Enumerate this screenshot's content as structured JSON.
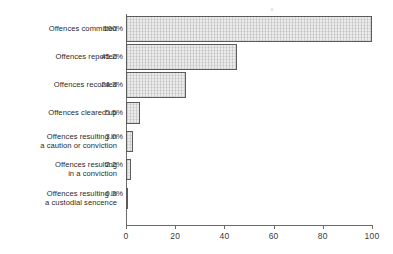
{
  "chart_data": {
    "type": "bar",
    "orientation": "horizontal",
    "title": "",
    "subtitle": "",
    "xlabel": "",
    "ylabel": "",
    "xlim": [
      0,
      100
    ],
    "grid": false,
    "legend": null,
    "categories": [
      "Offences committed",
      "Offences reported",
      "Offences recorded",
      "Offences cleared up",
      "Offences resulting in a caution or conviction",
      "Offences resulting in a conviction",
      "Offences resulting in a custodial sencence"
    ],
    "category_lines": [
      [
        "Offences committed"
      ],
      [
        "Offences reported"
      ],
      [
        "Offences recorded"
      ],
      [
        "Offences cleared up"
      ],
      [
        "Offences resulting in",
        "a caution or conviction"
      ],
      [
        "Offences resulting",
        "in a conviction"
      ],
      [
        "Offences resulting in",
        "a custodial sencence"
      ]
    ],
    "values": [
      100,
      45.2,
      24.3,
      5.5,
      3.0,
      2.2,
      0.3
    ],
    "value_labels": [
      "100%",
      "45.2%",
      "24.3%",
      "5.5%",
      "3.0%",
      "2.2%",
      "0.3%"
    ],
    "xticks": [
      0,
      20,
      40,
      60,
      80,
      100
    ],
    "xtick_labels": [
      "0",
      "20",
      "40",
      "60",
      "80",
      "100"
    ],
    "colors": {
      "bar_fill": "#ebebeb",
      "bar_border": "#5c5c5c",
      "axis": "#6b6b6b",
      "text": "#2b2b2b",
      "background": "#ffffff"
    }
  }
}
